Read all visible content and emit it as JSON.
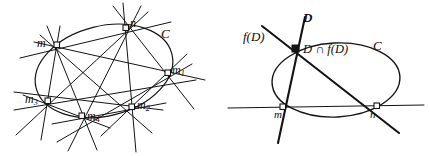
{
  "figure": {
    "panels": [
      {
        "name": "left-panel",
        "conic_label": "C",
        "points": [
          {
            "id": "m",
            "label": "m",
            "x": 57,
            "y": 45
          },
          {
            "id": "n",
            "label": "n",
            "x": 126,
            "y": 28
          },
          {
            "id": "m1",
            "label": "m",
            "sub": "1",
            "x": 168,
            "y": 73
          },
          {
            "id": "m2",
            "label": "m",
            "sub": "2",
            "x": 132,
            "y": 107
          },
          {
            "id": "m3",
            "label": "m",
            "sub": "3",
            "x": 48,
            "y": 101
          },
          {
            "id": "m4",
            "label": "m",
            "sub": "4",
            "x": 82,
            "y": 116
          }
        ],
        "label_positions": {
          "m": {
            "x": 37,
            "y": 39
          },
          "n": {
            "x": 130,
            "y": 19
          },
          "m1": {
            "x": 172,
            "y": 66
          },
          "m2": {
            "x": 137,
            "y": 101
          },
          "m3": {
            "x": 25,
            "y": 95
          },
          "m4": {
            "x": 87,
            "y": 112
          },
          "C": {
            "x": 161,
            "y": 29
          }
        }
      },
      {
        "name": "right-panel",
        "conic_label": "C",
        "line_labels": {
          "D": "D",
          "fD": "f(D)",
          "intersection": "D ∩ f(D)"
        },
        "points": [
          {
            "id": "isect",
            "label": "",
            "x": 296,
            "y": 49
          },
          {
            "id": "m",
            "label": "m",
            "x": 283,
            "y": 107
          },
          {
            "id": "n",
            "label": "n",
            "x": 377,
            "y": 107
          }
        ],
        "label_positions": {
          "D": {
            "x": 303,
            "y": 14
          },
          "fD": {
            "x": 246,
            "y": 32
          },
          "isect": {
            "x": 303,
            "y": 44
          },
          "C": {
            "x": 375,
            "y": 41
          },
          "m": {
            "x": 276,
            "y": 111
          },
          "n": {
            "x": 371,
            "y": 111
          }
        }
      }
    ],
    "stroke_color": "#141414",
    "background_color": "#ffffff"
  }
}
